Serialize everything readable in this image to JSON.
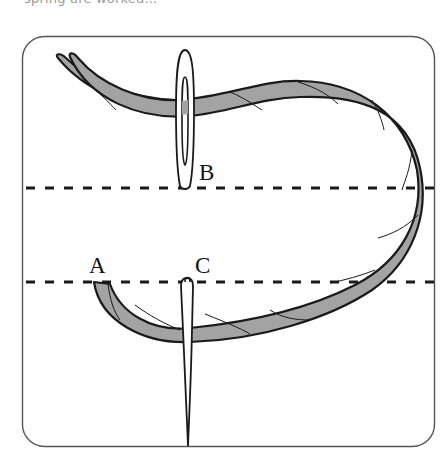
{
  "caption": {
    "text": "spring are worked..."
  },
  "diagram": {
    "labels": {
      "a": "A",
      "b": "B",
      "c": "C"
    },
    "colors": {
      "frame_stroke": "#555555",
      "thread_fill": "#a3a3a3",
      "thread_stroke": "#1a1a1a",
      "needle_fill": "#ffffff",
      "needle_stroke": "#1a1a1a",
      "dash_color": "#1a1a1a",
      "background": "#ffffff"
    },
    "guide_lines": [
      {
        "name": "upper-guide-line",
        "y": 188
      },
      {
        "name": "lower-guide-line",
        "y": 282
      }
    ]
  }
}
